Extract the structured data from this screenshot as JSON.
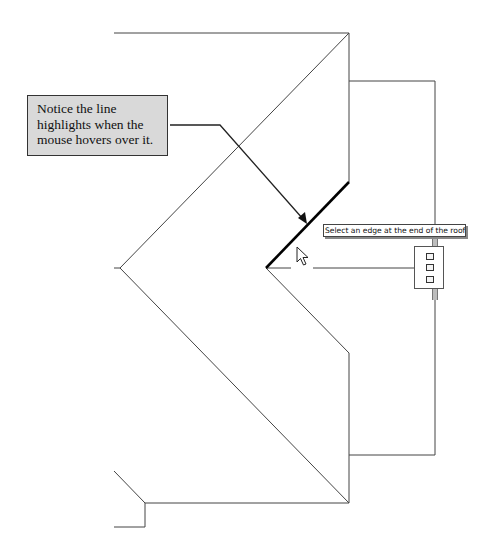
{
  "callout": {
    "lines": [
      "Notice the line",
      "highlights when the",
      "mouse hovers over it."
    ]
  },
  "tooltip": {
    "text": "Select an edge at the end of the roof tha"
  },
  "drawing": {
    "description": "Roof plan sketch with highlighted edge under mouse cursor",
    "line_color": "#333333",
    "highlight_color": "#000000",
    "callout_fill": "#d9d9d9"
  },
  "icons": {
    "cursor": "mouse-pointer-icon",
    "grip": "edge-grip-handle-icon"
  }
}
